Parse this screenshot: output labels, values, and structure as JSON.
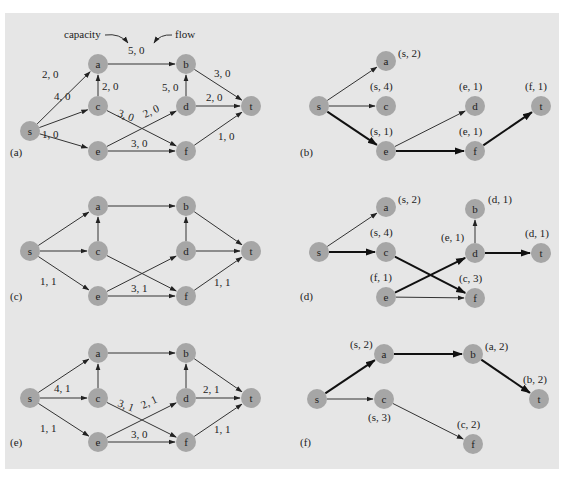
{
  "figure": {
    "background": "#e6e6e6",
    "node_color": "#a6a6a6",
    "annotations": {
      "capacity": "capacity",
      "flow": "flow"
    },
    "panels": [
      {
        "id": "a",
        "label": "(a)",
        "nodes": {
          "s": [
            30,
            131
          ],
          "a": [
            98,
            64
          ],
          "c": [
            98,
            106
          ],
          "e": [
            98,
            151
          ],
          "b": [
            186,
            64
          ],
          "d": [
            186,
            106
          ],
          "f": [
            186,
            151
          ],
          "t": [
            251,
            106
          ]
        },
        "edges": [
          {
            "from": "s",
            "to": "a",
            "label": "2, 0",
            "lx": 42,
            "ly": 78
          },
          {
            "from": "s",
            "to": "c",
            "label": "4, 0",
            "lx": 54,
            "ly": 100
          },
          {
            "from": "s",
            "to": "e",
            "label": "1, 0",
            "lx": 42,
            "ly": 138
          },
          {
            "from": "c",
            "to": "a",
            "label": "2, 0",
            "lx": 102,
            "ly": 90
          },
          {
            "from": "a",
            "to": "b",
            "label": "5, 0",
            "lx": 128,
            "ly": 54
          },
          {
            "from": "c",
            "to": "f",
            "label": "3, 0",
            "lx": 117,
            "ly": 116,
            "rot": 20
          },
          {
            "from": "e",
            "to": "d",
            "label": "2, 0",
            "lx": 145,
            "ly": 118,
            "rot": -25
          },
          {
            "from": "e",
            "to": "f",
            "label": "3, 0",
            "lx": 131,
            "ly": 147
          },
          {
            "from": "d",
            "to": "b",
            "label": "5, 0",
            "lx": 162,
            "ly": 91
          },
          {
            "from": "b",
            "to": "t",
            "label": "3, 0",
            "lx": 214,
            "ly": 77
          },
          {
            "from": "d",
            "to": "t",
            "label": "2, 0",
            "lx": 206,
            "ly": 101
          },
          {
            "from": "f",
            "to": "t",
            "label": "1, 0",
            "lx": 218,
            "ly": 140
          }
        ]
      },
      {
        "id": "b",
        "label": "(b)",
        "nodes": {
          "s": [
            319,
            106
          ],
          "a": [
            386,
            61
          ],
          "c": [
            386,
            106
          ],
          "e": [
            386,
            151
          ],
          "d": [
            475,
            106
          ],
          "f": [
            475,
            151
          ],
          "t": [
            541,
            106
          ]
        },
        "node_labels": {
          "a": "(s, 2)",
          "c": "(s, 4)",
          "e": "(s, 1)",
          "d": "(e, 1)",
          "f": "(e, 1)",
          "t": "(f, 1)"
        },
        "edges": [
          {
            "from": "s",
            "to": "a"
          },
          {
            "from": "s",
            "to": "c"
          },
          {
            "from": "s",
            "to": "e",
            "bold": true
          },
          {
            "from": "e",
            "to": "d"
          },
          {
            "from": "e",
            "to": "f",
            "bold": true
          },
          {
            "from": "f",
            "to": "t",
            "bold": true
          }
        ]
      },
      {
        "id": "c",
        "label": "(c)",
        "nodes": {
          "s": [
            30,
            251
          ],
          "a": [
            98,
            206
          ],
          "c": [
            98,
            251
          ],
          "e": [
            98,
            296
          ],
          "b": [
            186,
            206
          ],
          "d": [
            186,
            251
          ],
          "f": [
            186,
            296
          ],
          "t": [
            251,
            251
          ]
        },
        "edges": [
          {
            "from": "s",
            "to": "a"
          },
          {
            "from": "s",
            "to": "c"
          },
          {
            "from": "s",
            "to": "e",
            "label": "1, 1",
            "lx": 40,
            "ly": 285
          },
          {
            "from": "c",
            "to": "a"
          },
          {
            "from": "a",
            "to": "b"
          },
          {
            "from": "c",
            "to": "f"
          },
          {
            "from": "e",
            "to": "d"
          },
          {
            "from": "e",
            "to": "f",
            "label": "3, 1",
            "lx": 131,
            "ly": 292
          },
          {
            "from": "d",
            "to": "b"
          },
          {
            "from": "b",
            "to": "t"
          },
          {
            "from": "d",
            "to": "t"
          },
          {
            "from": "f",
            "to": "t",
            "label": "1, 1",
            "lx": 214,
            "ly": 286
          }
        ]
      },
      {
        "id": "d",
        "label": "(d)",
        "nodes": {
          "s": [
            319,
            252
          ],
          "a": [
            386,
            207
          ],
          "c": [
            386,
            252
          ],
          "e": [
            386,
            297
          ],
          "b": [
            475,
            209
          ],
          "d": [
            475,
            253
          ],
          "f": [
            475,
            298
          ],
          "t": [
            541,
            253
          ]
        },
        "node_labels": {
          "a": "(s, 2)",
          "c": "(s, 4)",
          "e": "(f, 1)",
          "b": "(d, 1)",
          "d": "(e, 1)",
          "f": "(c, 3)",
          "t": "(d, 1)"
        },
        "edges": [
          {
            "from": "s",
            "to": "a"
          },
          {
            "from": "s",
            "to": "c",
            "bold": true
          },
          {
            "from": "c",
            "to": "f",
            "bold": true
          },
          {
            "from": "e",
            "to": "d",
            "bold": true
          },
          {
            "from": "e",
            "to": "f"
          },
          {
            "from": "d",
            "to": "b"
          },
          {
            "from": "d",
            "to": "t",
            "bold": true
          }
        ]
      },
      {
        "id": "e",
        "label": "(e)",
        "nodes": {
          "s": [
            30,
            398
          ],
          "a": [
            98,
            353
          ],
          "c": [
            98,
            398
          ],
          "e": [
            98,
            442
          ],
          "b": [
            186,
            353
          ],
          "d": [
            186,
            398
          ],
          "f": [
            186,
            442
          ],
          "t": [
            251,
            398
          ]
        },
        "edges": [
          {
            "from": "s",
            "to": "a"
          },
          {
            "from": "s",
            "to": "c",
            "label": "4, 1",
            "lx": 54,
            "ly": 392
          },
          {
            "from": "s",
            "to": "e",
            "label": "1, 1",
            "lx": 40,
            "ly": 432
          },
          {
            "from": "c",
            "to": "a"
          },
          {
            "from": "a",
            "to": "b"
          },
          {
            "from": "c",
            "to": "f",
            "label": "3, 1",
            "lx": 117,
            "ly": 406,
            "rot": 20
          },
          {
            "from": "e",
            "to": "d",
            "label": "2, 1",
            "lx": 143,
            "ly": 409,
            "rot": -25
          },
          {
            "from": "e",
            "to": "f",
            "label": "3, 0",
            "lx": 131,
            "ly": 438
          },
          {
            "from": "d",
            "to": "b"
          },
          {
            "from": "b",
            "to": "t"
          },
          {
            "from": "d",
            "to": "t",
            "label": "2, 1",
            "lx": 203,
            "ly": 393
          },
          {
            "from": "f",
            "to": "t",
            "label": "1, 1",
            "lx": 214,
            "ly": 433
          }
        ]
      },
      {
        "id": "f",
        "label": "(f)",
        "nodes": {
          "s": [
            317,
            399
          ],
          "a": [
            384,
            354
          ],
          "c": [
            384,
            399
          ],
          "b": [
            473,
            354
          ],
          "t": [
            539,
            399
          ],
          "f": [
            473,
            444
          ]
        },
        "node_labels": {
          "a": "(s, 2)",
          "c": "(s, 3)",
          "b": "(a, 2)",
          "t": "(b, 2)",
          "f": "(c, 2)"
        },
        "edges": [
          {
            "from": "s",
            "to": "a",
            "bold": true
          },
          {
            "from": "a",
            "to": "b",
            "bold": true
          },
          {
            "from": "b",
            "to": "t",
            "bold": true
          },
          {
            "from": "s",
            "to": "c"
          },
          {
            "from": "c",
            "to": "f"
          }
        ]
      }
    ]
  }
}
